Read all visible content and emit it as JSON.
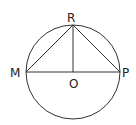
{
  "diagram": {
    "type": "geometry-circle-triangle",
    "circle": {
      "center": "O",
      "cx": 73,
      "cy": 72,
      "r": 47
    },
    "points": {
      "R": {
        "label": "R",
        "x": 73,
        "y": 25
      },
      "M": {
        "label": "M",
        "x": 26,
        "y": 72
      },
      "P": {
        "label": "P",
        "x": 120,
        "y": 72
      },
      "O": {
        "label": "O",
        "x": 73,
        "y": 72
      }
    },
    "segments": [
      "MP",
      "MR",
      "RP",
      "RO"
    ],
    "stroke_color": "#333333"
  }
}
